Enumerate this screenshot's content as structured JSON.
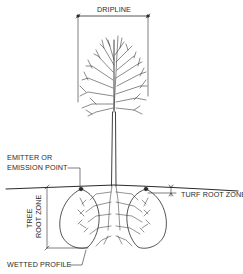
{
  "diagram": {
    "labels": {
      "dripline": "DRIPLINE",
      "emitter_line1": "EMITTER OR",
      "emitter_line2": "EMISSION POINT",
      "turf_root_zone": "TURF ROOT ZONE",
      "tree_root_zone_line1": "TREE",
      "tree_root_zone_line2": "ROOT ZONE",
      "wetted_profile": "WETTED PROFILE"
    },
    "colors": {
      "line": "#2a2a2a",
      "background": "#ffffff"
    }
  }
}
